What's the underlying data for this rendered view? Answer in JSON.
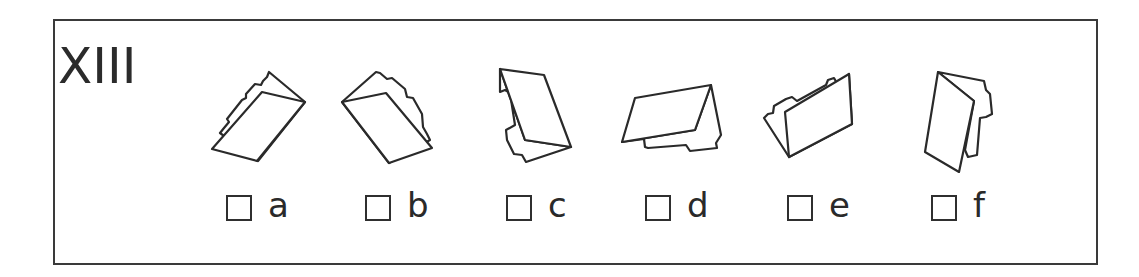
{
  "question": {
    "number_label": "XIII"
  },
  "options": [
    {
      "letter": "a",
      "figure": "folder-icon",
      "checked": false
    },
    {
      "letter": "b",
      "figure": "folder-icon",
      "checked": false
    },
    {
      "letter": "c",
      "figure": "folder-icon",
      "checked": false
    },
    {
      "letter": "d",
      "figure": "folder-icon",
      "checked": false
    },
    {
      "letter": "e",
      "figure": "folder-icon",
      "checked": false
    },
    {
      "letter": "f",
      "figure": "folder-icon",
      "checked": false
    }
  ],
  "colors": {
    "stroke": "#2a2a2a",
    "background": "#ffffff",
    "frame": "#3a3a3a"
  }
}
